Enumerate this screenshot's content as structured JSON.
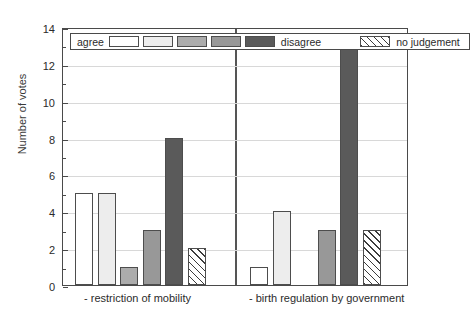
{
  "chart_data": {
    "type": "bar",
    "title": "",
    "xlabel": "",
    "ylabel": "Number of votes",
    "ylim": [
      0,
      14
    ],
    "ytick_values": [
      0,
      2,
      4,
      6,
      8,
      10,
      12,
      14
    ],
    "ytick_labels": [
      "0",
      "2",
      "4",
      "6",
      "8",
      "10",
      "12",
      "14"
    ],
    "minor_ytick_values": [
      1,
      3,
      5,
      7,
      9,
      11,
      13
    ],
    "grid": "horizontal",
    "legend_position": "top-inside",
    "categories": [
      "- restriction of mobility",
      "- birth regulation by government"
    ],
    "response_scale": {
      "low_label": "agree",
      "high_label": "disagree",
      "extra_label": "no judgement"
    },
    "series": [
      {
        "name": "agree",
        "key": "s1",
        "color": "#ffffff",
        "pattern": "solid",
        "values": [
          5,
          1
        ]
      },
      {
        "name": "scale-2",
        "key": "s2",
        "color": "#ededed",
        "pattern": "solid",
        "values": [
          5,
          4
        ]
      },
      {
        "name": "scale-3",
        "key": "s3",
        "color": "#acacac",
        "pattern": "solid",
        "values": [
          1,
          0
        ]
      },
      {
        "name": "scale-4",
        "key": "s4",
        "color": "#989898",
        "pattern": "solid",
        "values": [
          3,
          3
        ]
      },
      {
        "name": "disagree",
        "key": "s5",
        "color": "#5a5a5a",
        "pattern": "solid",
        "values": [
          8,
          13
        ]
      },
      {
        "name": "no judgement",
        "key": "s6",
        "color": "#ffffff",
        "pattern": "diagonal-hatch",
        "values": [
          2,
          3
        ]
      }
    ]
  },
  "legend": {
    "agree_label": "agree",
    "disagree_label": "disagree",
    "no_judgement_label": "no judgement"
  },
  "axis": {
    "y_title": "Number of votes"
  },
  "groups": [
    {
      "label": "- restriction of mobility"
    },
    {
      "label": "- birth regulation by government"
    }
  ]
}
